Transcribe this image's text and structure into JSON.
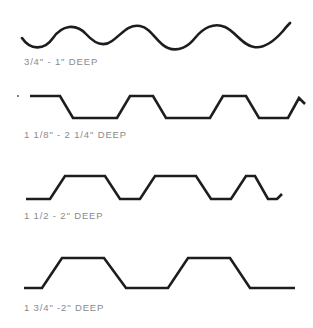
{
  "drawing": {
    "title": "Corrugated and ribbed panel profile depths",
    "stroke_color": "#1d1d1f",
    "caption_color": "#8a8a8a",
    "background_color": "#ffffff"
  },
  "profiles": [
    {
      "id": "sinusoidal-corrugated",
      "shape_type": "sine-wave",
      "caption": "3/4\" - 1\" DEEP",
      "caption_x": 24,
      "caption_y": 57,
      "block_top": 4,
      "svg_height": 48,
      "stroke_width": 2.6,
      "path": "M 22 34 C 30 46 44 47 53 34 C 62 21 76 19 86 30 C 95 40 104 43 112 37 C 122 30 128 20 140 22 C 152 24 157 40 168 44 C 178 48 188 43 195 34 C 203 24 214 18 225 23 C 236 28 242 41 254 43 C 266 45 276 35 283 27 C 286 23 288 21 290 19"
    },
    {
      "id": "narrow-trapezoid-rib",
      "shape_type": "trapezoidal-rib",
      "caption": "1 1/8\" - 2 1/4\" DEEP",
      "caption_x": 24,
      "caption_y": 130,
      "block_top": 88,
      "svg_height": 42,
      "stroke_width": 2.6,
      "path": "M 30 8 L 60 8 L 73 30 L 117 30 L 130 8 L 153 8 L 166 30 L 210 30 L 223 8 L 246 8 L 259 30 L 288 30 L 299 10 L 305 16",
      "artifact_dot": {
        "x": 17,
        "y": 95
      }
    },
    {
      "id": "medium-trapezoid-rib",
      "shape_type": "trapezoidal-rib",
      "caption": "1 1/2 - 2\"  DEEP",
      "caption_x": 24,
      "caption_y": 211,
      "block_top": 166,
      "svg_height": 44,
      "stroke_width": 2.6,
      "path": "M 26 33 L 50 33 L 65 10 L 105 10 L 120 33 L 140 33 L 155 10 L 196 10 L 211 33 L 231 33 L 246 10 L 255 10 L 268 33 L 277 33 L 282 28"
    },
    {
      "id": "deep-trapezoid-rib",
      "shape_type": "trapezoidal-rib",
      "caption": "1 3/4\" -2\" DEEP",
      "caption_x": 24,
      "caption_y": 303,
      "block_top": 248,
      "svg_height": 50,
      "stroke_width": 2.6,
      "path": "M 24 40 L 42 40 L 62 10 L 104 10 L 126 40 L 168 40 L 188 10 L 230 10 L 250 40 L 295 40"
    }
  ]
}
